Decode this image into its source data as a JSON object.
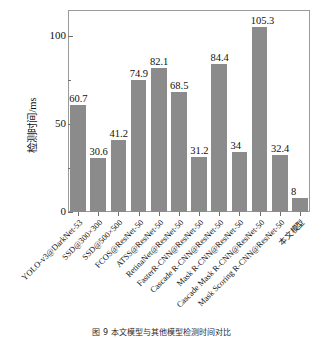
{
  "chart_data": {
    "type": "bar",
    "title": "",
    "xlabel": "",
    "ylabel": "检测时间/ms",
    "ylim": [
      0,
      115
    ],
    "yticks": [
      0,
      50,
      100
    ],
    "ytick_labels": [
      "0",
      "50",
      "100"
    ],
    "grid": false,
    "legend": null,
    "bar_color": "#8b8b8b",
    "categories": [
      "YOLO-v3@DarkNet-53",
      "SSD@300×300",
      "SSD@500×500",
      "FCOS@ResNet-50",
      "ATSS@ResNet-50",
      "RetinaNet@ResNet-50",
      "FasterR-CNN@ResNet-50",
      "Cascade R-CNN@ResNet-50",
      "Mask R-CNN@ResNet-50",
      "Cascade Mask R-CNN@ResNet-50",
      "Mask Scoring R-CNN@ResNet-50",
      "本文模型"
    ],
    "values": [
      60.7,
      30.6,
      41.2,
      74.9,
      82.1,
      68.5,
      31.2,
      84.4,
      34,
      105.3,
      32.4,
      8
    ],
    "value_labels": [
      "60.7",
      "30.6",
      "41.2",
      "74.9",
      "82.1",
      "68.5",
      "31.2",
      "84.4",
      "34",
      "105.3",
      "32.4",
      "8"
    ]
  },
  "caption": "图 9   本文模型与其他模型检测时间对比"
}
